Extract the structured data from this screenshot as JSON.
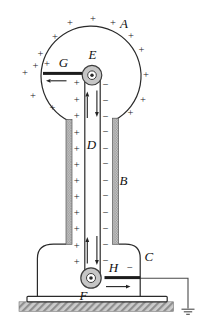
{
  "labels": {
    "A": "A",
    "B": "B",
    "C": "C",
    "D": "D",
    "E": "E",
    "F": "F",
    "G": "G",
    "H": "H"
  },
  "charges": {
    "plus_symbol": "+",
    "minus_symbol": "−",
    "plus": [
      [
        55,
        37
      ],
      [
        70,
        22.5
      ],
      [
        93,
        18.5
      ],
      [
        113,
        23
      ],
      [
        131,
        35.5
      ],
      [
        141.5,
        50
      ],
      [
        146,
        74.5
      ],
      [
        143,
        99.5
      ],
      [
        130.5,
        113
      ],
      [
        40.5,
        53.5
      ],
      [
        35.5,
        66
      ],
      [
        25,
        73
      ],
      [
        33,
        96
      ],
      [
        52.5,
        107.5
      ],
      [
        47,
        63.5
      ],
      [
        76.8,
        83
      ],
      [
        76.8,
        99.5
      ],
      [
        76.8,
        116
      ],
      [
        76.8,
        132.5
      ],
      [
        76.8,
        149
      ],
      [
        76.8,
        164.5
      ],
      [
        76.8,
        181
      ],
      [
        76.8,
        196.5
      ],
      [
        76.8,
        212.5
      ],
      [
        76.8,
        228.5
      ],
      [
        76.8,
        246
      ],
      [
        76.8,
        261.5
      ]
    ],
    "minus": [
      [
        105.8,
        85
      ],
      [
        105.8,
        100.5
      ],
      [
        105.8,
        116.5
      ],
      [
        105.8,
        132
      ],
      [
        105.8,
        148.5
      ],
      [
        105.8,
        163.5
      ],
      [
        105.8,
        180.5
      ],
      [
        105.8,
        196
      ],
      [
        105.8,
        213
      ],
      [
        105.8,
        229
      ],
      [
        105.8,
        245
      ],
      [
        105.8,
        260.5
      ],
      [
        130,
        267.5
      ]
    ]
  },
  "colors": {
    "ink": "#2a2a2a",
    "stipple_fill": "#c4c4c4",
    "stipple_dot": "#6a6a6a",
    "hatch_bg": "#cccccc",
    "hatch_line": "#8f8f8f",
    "pulley_fill": "#c6c6c6",
    "background": "#ffffff"
  }
}
